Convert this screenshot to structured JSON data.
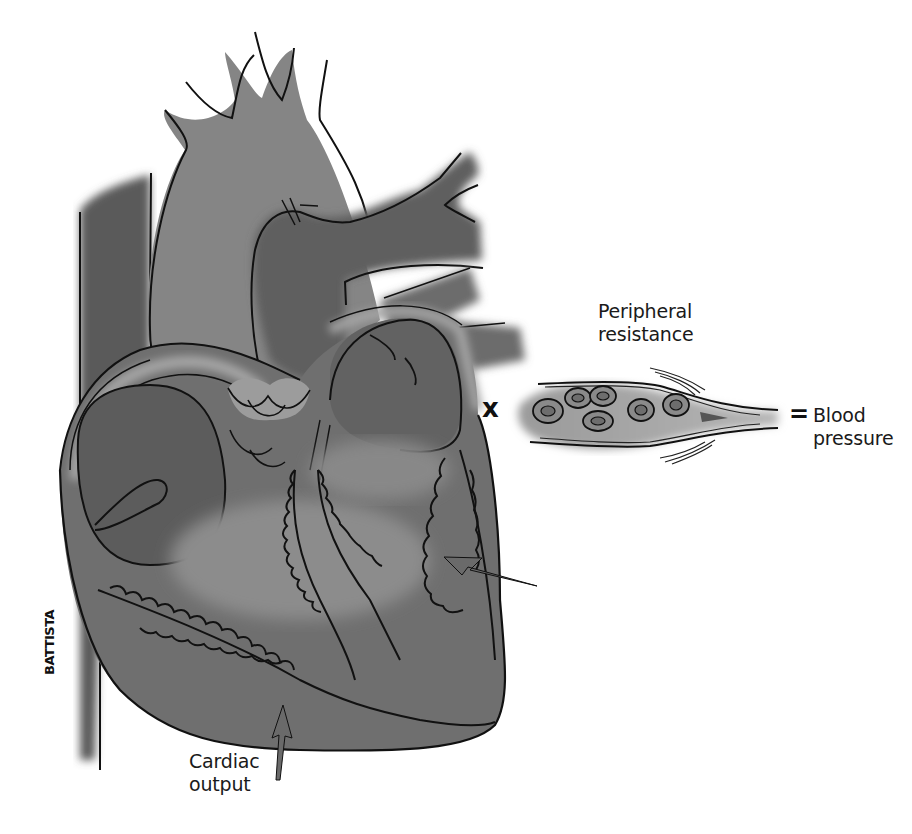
{
  "figure": {
    "equation": {
      "term1": "Cardiac output",
      "operator": "x",
      "term2": "Peripheral resistance",
      "equals": "=",
      "result": "Blood pressure"
    },
    "labels": {
      "cardiac_output_line1": "Cardiac",
      "cardiac_output_line2": "output",
      "peripheral_line1": "Peripheral",
      "peripheral_line2": "resistance",
      "times_symbol": "x",
      "equals_symbol": "=",
      "blood_pressure_line1": "Blood",
      "blood_pressure_line2": "pressure"
    },
    "signature": "BATTISTA",
    "colors": {
      "background": "#ffffff",
      "light_tissue": "#8a8a8a",
      "mid_tissue": "#727272",
      "dark_tissue": "#5e5e5e",
      "outline": "#111111",
      "rim_highlight": "#a8a8a8",
      "arrow_fill": "#6a6a6a"
    }
  }
}
